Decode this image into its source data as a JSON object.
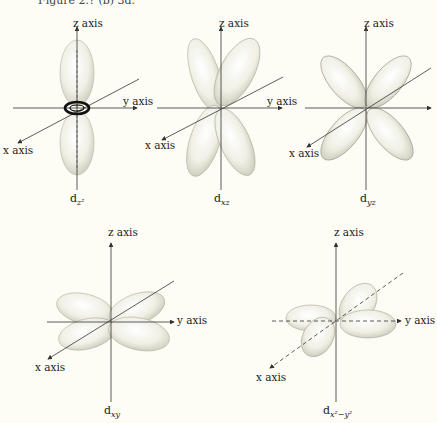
{
  "caption": "Figure 2.? (b) 3d.",
  "axis_labels": {
    "x": "x axis",
    "y": "y axis",
    "z": "z axis"
  },
  "orbitals": [
    {
      "name": "d",
      "sub": "z²",
      "label_text": "dz²"
    },
    {
      "name": "d",
      "sub": "xz",
      "label_text": "dxz"
    },
    {
      "name": "d",
      "sub": "yz",
      "label_text": "dyz"
    },
    {
      "name": "d",
      "sub": "xy",
      "label_text": "dxy"
    },
    {
      "name": "d",
      "sub": "x²−y²",
      "label_text": "dx²−y²"
    }
  ],
  "colors": {
    "background": "#fdfdf6",
    "axis": "#333333",
    "lobe_fill": "#eeeee2",
    "lobe_edge": "#a9a99a",
    "lobe_shadow": "#c8c8b8"
  }
}
